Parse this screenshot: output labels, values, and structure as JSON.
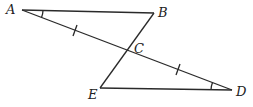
{
  "diagram": {
    "type": "geometry",
    "points": {
      "A": {
        "label": "A",
        "x": 22,
        "y": 10
      },
      "B": {
        "label": "B",
        "x": 154,
        "y": 13
      },
      "C": {
        "label": "C",
        "x": 126,
        "y": 50
      },
      "D": {
        "label": "D",
        "x": 232,
        "y": 90
      },
      "E": {
        "label": "E",
        "x": 100,
        "y": 88
      }
    },
    "segments": [
      "AB",
      "AD",
      "BE",
      "ED"
    ],
    "markings": {
      "tick_marks": [
        "AC",
        "CD"
      ],
      "angle_arcs": [
        "A",
        "D"
      ]
    },
    "colors": {
      "line": "#2a2a2a",
      "background": "#ffffff"
    }
  }
}
